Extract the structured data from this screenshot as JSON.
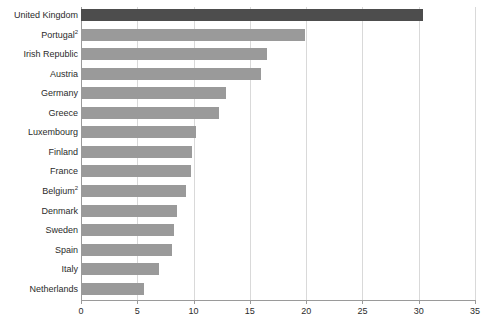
{
  "chart_data": {
    "type": "bar",
    "orientation": "horizontal",
    "title": "",
    "subtitle": "",
    "xlabel": "",
    "ylabel": "",
    "xlim": [
      0,
      35
    ],
    "xticks": [
      0,
      5,
      10,
      15,
      20,
      25,
      30,
      35
    ],
    "xtick_labels": [
      "0",
      "5",
      "10",
      "15",
      "20",
      "25",
      "30",
      "35"
    ],
    "grid": "vertical",
    "legend": "none",
    "categories": [
      "United Kingdom",
      "Portugal",
      "Irish Republic",
      "Austria",
      "Germany",
      "Greece",
      "Luxembourg",
      "Finland",
      "France",
      "Belgium",
      "Denmark",
      "Sweden",
      "Spain",
      "Italy",
      "Netherlands"
    ],
    "category_footnotes": [
      "",
      "2",
      "",
      "",
      "",
      "",
      "",
      "",
      "",
      "2",
      "",
      "",
      "",
      "",
      ""
    ],
    "values": [
      30.4,
      19.9,
      16.5,
      16.0,
      12.9,
      12.3,
      10.2,
      9.9,
      9.8,
      9.3,
      8.5,
      8.3,
      8.1,
      6.9,
      5.6
    ],
    "colors": {
      "bar_default": "#9a9a9a",
      "bar_highlight": "#4d4d4d",
      "gridline": "#d9d9d9",
      "axis": "#9a9a9a",
      "text": "#2b2b2b",
      "background": "#ffffff"
    },
    "highlight_index": 0
  }
}
